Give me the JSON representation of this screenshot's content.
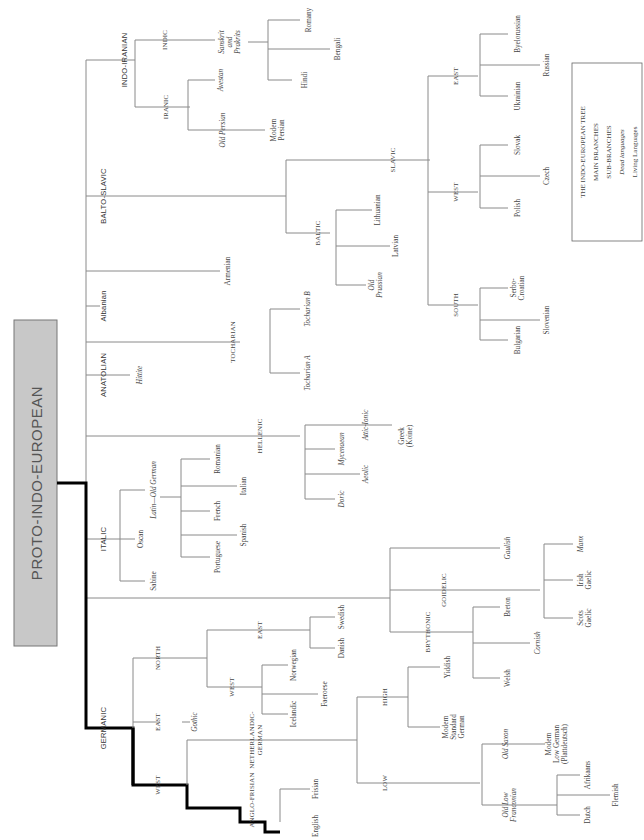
{
  "title": "PROTO-INDO-EUROPEAN",
  "colors": {
    "title_box": "#c8c8c8",
    "line": "#8a8a8a",
    "highlight": "#000000"
  },
  "legend": {
    "heading": "THE INDO-EUROPEAN TREE",
    "items": [
      "MAIN BRANCHES",
      "SUB-BRANCHES",
      "Dead languages",
      "Living Languages"
    ]
  },
  "main_branches": {
    "indo_iranian": "INDO-IRANIAN",
    "balto_slavic": "BALTO-SLAVIC",
    "albanian": "Albanian",
    "anatolian": "ANATOLIAN",
    "italic": "ITALIC",
    "germanic": "GERMANIC"
  },
  "sub": {
    "indic": "INDIC",
    "iranic": "IRANIC",
    "slavic": "SLAVIC",
    "baltic": "BALTIC",
    "slavic_east": "EAST",
    "slavic_west": "WEST",
    "slavic_south": "SOUTH",
    "tocharian": "TOCHARIAN",
    "hellenic": "HELLENIC",
    "celtic": "CELTIC",
    "goidelic": "GOIDELIC",
    "brythonic": "BRYTHONIC",
    "ger_north": "NORTH",
    "ger_east": "EAST",
    "ger_west": "WEST",
    "north_east": "EAST",
    "north_west": "WEST",
    "neth_german": [
      "NETHERLANDIC-",
      "GERMAN"
    ],
    "anglo_frisian": "ANGLO-FRISIAN",
    "high": "HIGH",
    "low": "LOW"
  },
  "languages": {
    "sanskrit": [
      "Sanskrit",
      "and",
      "Prakrits"
    ],
    "avestan": "Avestan",
    "old_persian": "Old Persian",
    "romany": "Romany",
    "bengali": "Bengali",
    "hindi": "Hindi",
    "modern_persian": [
      "Modern",
      "Persian"
    ],
    "byelorussian": "Byelorussian",
    "russian": "Russian",
    "ukrainian": "Ukrainian",
    "slovak": "Slovak",
    "czech": "Czech",
    "polish": "Polish",
    "serbo_croatian": [
      "Serbo-",
      "Croatian"
    ],
    "slovenian": "Slovenian",
    "bulgarian": "Bulgarian",
    "lithuanian": "Lithuanian",
    "latvian": "Latvian",
    "old_prussian": [
      "Old",
      "Prussian"
    ],
    "armenian": "Armenian",
    "tocharian_a": "Tocharian A",
    "tocharian_b": "Tocharian B",
    "hittite": "Hittite",
    "attic_ionic": "Attic-Ionic",
    "greek_koine": [
      "Greek",
      "(Koine)"
    ],
    "mycenaean": "Mycenaean",
    "aeolic": "Aeolic",
    "doric": "Doric",
    "latin": "Latin—Old German",
    "oscan": "Oscan",
    "sabine": "Sabine",
    "romanian": "Romanian",
    "italian": "Italian",
    "french": "French",
    "spanish": "Spanish",
    "portuguese": "Portuguese",
    "gaulish": "Gaulish",
    "manx": "Manx",
    "irish_gaelic": [
      "Irish",
      "Gaelic"
    ],
    "scots_gaelic": [
      "Scots",
      "Gaelic"
    ],
    "breton": "Breton",
    "cornish": "Cornish",
    "welsh": "Welsh",
    "swedish": "Swedish",
    "danish": "Danish",
    "norwegian": "Norwegian",
    "faeroese": "Faeroese",
    "icelandic": "Icelandic",
    "gothic": "Gothic",
    "yiddish": "Yiddish",
    "modern_std_german": [
      "Modern",
      "Standard",
      "German"
    ],
    "old_saxon": "Old Saxon",
    "modern_low_german": [
      "Modern",
      "Low German",
      "(Plattdeutsch)"
    ],
    "old_low_franconian": [
      "Old Low",
      "Franconian"
    ],
    "afrikaans": "Afrikaans",
    "flemish": "Flemish",
    "dutch": "Dutch",
    "frisian": "Frisian",
    "english": "English"
  }
}
